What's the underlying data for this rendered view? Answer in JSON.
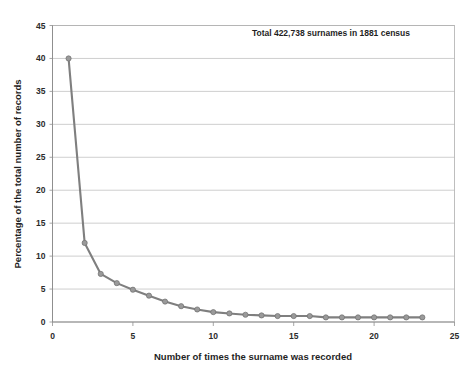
{
  "chart_data": {
    "type": "line",
    "title": "",
    "annotation": "Total  422,738 surnames  in 1881 census",
    "xlabel": "Number of times  the surname was recorded",
    "ylabel": "Percentage of the total number of records",
    "xlim": [
      0,
      25
    ],
    "ylim": [
      0,
      45
    ],
    "xticks": [
      0,
      5,
      10,
      15,
      20,
      25
    ],
    "yticks": [
      0,
      5,
      10,
      15,
      20,
      25,
      30,
      35,
      40,
      45
    ],
    "xtick_labels": [
      "0",
      "5",
      "10",
      "15",
      "20",
      "25"
    ],
    "ytick_labels": [
      "0",
      "5",
      "10",
      "15",
      "20",
      "25",
      "30",
      "35",
      "40",
      "45"
    ],
    "grid": "horizontal",
    "legend": "none",
    "line_color": "#7f7f7f",
    "marker_color": "#9a9a9a",
    "x": [
      1,
      2,
      3,
      4,
      5,
      6,
      7,
      8,
      9,
      10,
      11,
      12,
      13,
      14,
      15,
      16,
      17,
      18,
      19,
      20,
      21,
      22,
      23
    ],
    "values": [
      40.0,
      12.0,
      7.3,
      5.9,
      4.9,
      4.0,
      3.1,
      2.4,
      1.9,
      1.5,
      1.3,
      1.1,
      1.0,
      0.9,
      0.9,
      0.9,
      0.7,
      0.7,
      0.7,
      0.7,
      0.7,
      0.7,
      0.7
    ],
    "series": [
      {
        "name": "Percentage of total records",
        "values": [
          40.0,
          12.0,
          7.3,
          5.9,
          4.9,
          4.0,
          3.1,
          2.4,
          1.9,
          1.5,
          1.3,
          1.1,
          1.0,
          0.9,
          0.9,
          0.9,
          0.7,
          0.7,
          0.7,
          0.7,
          0.7,
          0.7,
          0.7
        ]
      }
    ]
  }
}
